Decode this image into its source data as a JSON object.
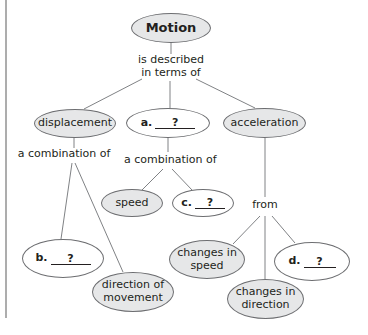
{
  "diagram": {
    "type": "concept-map",
    "colors": {
      "filled_node": "#e6e7e8",
      "blank_node": "#ffffff",
      "stroke": "#6d6e71",
      "text": "#231f20",
      "side_rule": "#808285"
    },
    "root": {
      "label": "Motion"
    },
    "links": {
      "root_to_level1": "is described\nin terms of",
      "displacement_to_children": "a combination of",
      "a_to_children": "a combination of",
      "acceleration_to_children": "from"
    },
    "level1": {
      "displacement": {
        "label": "displacement"
      },
      "a_blank": {
        "letter": "a.",
        "placeholder": "?"
      },
      "acceleration": {
        "label": "acceleration"
      }
    },
    "level2": {
      "b_blank": {
        "letter": "b.",
        "placeholder": "?"
      },
      "direction_of_movement": {
        "label": "direction of\nmovement"
      },
      "speed": {
        "label": "speed"
      },
      "c_blank": {
        "letter": "c.",
        "placeholder": "?"
      },
      "changes_in_speed": {
        "label": "changes in\nspeed"
      },
      "changes_in_direction": {
        "label": "changes in\ndirection"
      },
      "d_blank": {
        "letter": "d.",
        "placeholder": "?"
      }
    }
  }
}
